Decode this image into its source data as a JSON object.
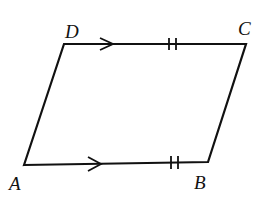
{
  "diagram": {
    "type": "parallelogram",
    "stroke_color": "#111111",
    "vertices": [
      {
        "name": "A",
        "x": 24,
        "y": 165,
        "label_x": 9,
        "label_y": 190
      },
      {
        "name": "B",
        "x": 208,
        "y": 162,
        "label_x": 194,
        "label_y": 189
      },
      {
        "name": "C",
        "x": 246,
        "y": 44,
        "label_x": 238,
        "label_y": 35
      },
      {
        "name": "D",
        "x": 64,
        "y": 44,
        "label_x": 65,
        "label_y": 38
      }
    ],
    "marks": {
      "parallel_arrows": [
        "DC",
        "AB"
      ],
      "equal_ticks": {
        "sides": [
          "DC",
          "AB"
        ],
        "count": 2
      }
    }
  }
}
